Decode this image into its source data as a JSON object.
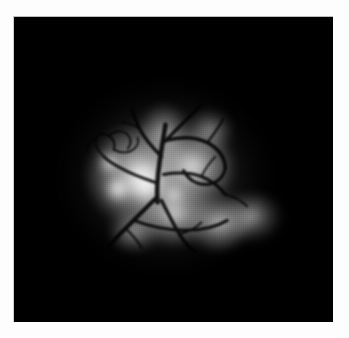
{
  "page": {
    "background_color": "#fdfdfd",
    "width": 349,
    "height": 338
  },
  "figure": {
    "name": "fluorescence-micrograph",
    "frame": {
      "left": 13,
      "top": 16,
      "width": 320,
      "height": 306,
      "background_color": "#000000",
      "border_color": "#c4c4c4"
    },
    "caption": "",
    "scale_bar_label": "",
    "annotations": []
  },
  "image_content": {
    "modality": "fluorescence-angiography",
    "colorspace": "grayscale",
    "background_color": "#000000",
    "highlight_color": "#ffffff",
    "vessel_color": "#1a1a1a",
    "halo": {
      "center_x": 152,
      "center_y": 160,
      "radius_x": 120,
      "radius_y": 108
    },
    "bright_lobes": [
      {
        "name": "upper-left-lobe",
        "x": 126,
        "y": 158,
        "rx": 56,
        "ry": 52,
        "intensity": 0.96
      },
      {
        "name": "upper-right-lobe",
        "x": 178,
        "y": 150,
        "rx": 44,
        "ry": 40,
        "intensity": 0.88
      },
      {
        "name": "lower-central-lobe",
        "x": 160,
        "y": 196,
        "rx": 40,
        "ry": 34,
        "intensity": 0.82
      },
      {
        "name": "lower-right-lobe",
        "x": 205,
        "y": 206,
        "rx": 34,
        "ry": 30,
        "intensity": 0.72
      },
      {
        "name": "far-right-lobe",
        "x": 238,
        "y": 200,
        "rx": 32,
        "ry": 26,
        "intensity": 0.62
      },
      {
        "name": "superior-lobe",
        "x": 150,
        "y": 116,
        "rx": 26,
        "ry": 30,
        "intensity": 0.62
      },
      {
        "name": "superior-right-lobe",
        "x": 196,
        "y": 114,
        "rx": 24,
        "ry": 22,
        "intensity": 0.52
      },
      {
        "name": "inferior-left-lobe",
        "x": 120,
        "y": 214,
        "rx": 26,
        "ry": 22,
        "intensity": 0.58
      }
    ],
    "hotspots": [
      {
        "name": "primary-hotspot",
        "x": 132,
        "y": 168,
        "r": 20,
        "intensity": 0.98
      },
      {
        "name": "secondary-hotspot",
        "x": 104,
        "y": 172,
        "r": 14,
        "intensity": 0.92
      },
      {
        "name": "tertiary-hotspot",
        "x": 96,
        "y": 146,
        "r": 12,
        "intensity": 0.8
      },
      {
        "name": "quaternary-hotspot",
        "x": 160,
        "y": 178,
        "r": 11,
        "intensity": 0.66
      }
    ],
    "vessel_tree": {
      "trunk_origin": {
        "x": 144,
        "y": 172
      },
      "primary_branches": 4,
      "capillary_tuft": {
        "x": 104,
        "y": 150,
        "radius": 22
      }
    }
  }
}
